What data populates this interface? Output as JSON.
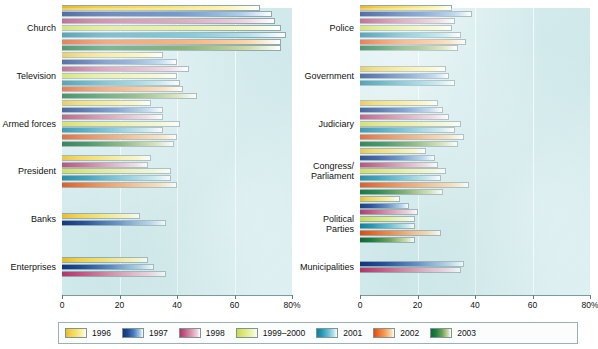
{
  "chart_data": {
    "type": "bar",
    "orientation": "horizontal",
    "title": "",
    "xlabel": "",
    "ylabel": "",
    "xlim": [
      0,
      80
    ],
    "xticks": [
      0,
      20,
      40,
      60,
      80
    ],
    "xticklabels": [
      "0",
      "20",
      "40",
      "60",
      "80%"
    ],
    "grid": true,
    "legend_position": "bottom",
    "series": [
      {
        "name": "1996",
        "color": "#f2cf45"
      },
      {
        "name": "1997",
        "color": "#1f4795"
      },
      {
        "name": "1998",
        "color": "#c4527f"
      },
      {
        "name": "1999–2000",
        "color": "#d7e36a"
      },
      {
        "name": "2001",
        "color": "#2295b2"
      },
      {
        "name": "2002",
        "color": "#ef6a22"
      },
      {
        "name": "2003",
        "color": "#1a7d3f"
      }
    ],
    "panels": [
      {
        "id": "left",
        "categories": [
          "Church",
          "Television",
          "Armed forces",
          "President",
          "Banks",
          "Enterprises"
        ],
        "values": [
          [
            69,
            73,
            74,
            76,
            78,
            76,
            76
          ],
          [
            35,
            40,
            44,
            40,
            41,
            42,
            47
          ],
          [
            31,
            35,
            35,
            41,
            35,
            40,
            39
          ],
          [
            31,
            null,
            30,
            38,
            38,
            40,
            null
          ],
          [
            27,
            36,
            null,
            null,
            null,
            null,
            null
          ],
          [
            30,
            32,
            36,
            null,
            null,
            null,
            null
          ]
        ]
      },
      {
        "id": "right",
        "categories": [
          "Police",
          "Government",
          "Judiciary",
          "Congress/\nParliament",
          "Political Parties",
          "Municipalities"
        ],
        "values": [
          [
            32,
            39,
            33,
            32,
            35,
            37,
            34
          ],
          [
            30,
            31,
            null,
            null,
            33,
            null,
            null
          ],
          [
            27,
            29,
            31,
            35,
            33,
            36,
            34
          ],
          [
            23,
            26,
            27,
            30,
            28,
            38,
            29
          ],
          [
            14,
            17,
            20,
            19,
            19,
            28,
            19
          ],
          [
            null,
            36,
            35,
            null,
            null,
            null,
            null
          ]
        ]
      }
    ]
  },
  "legend": {
    "items": [
      {
        "label": "1996"
      },
      {
        "label": "1997"
      },
      {
        "label": "1998"
      },
      {
        "label": "1999–2000"
      },
      {
        "label": "2001"
      },
      {
        "label": "2002"
      },
      {
        "label": "2003"
      }
    ]
  }
}
